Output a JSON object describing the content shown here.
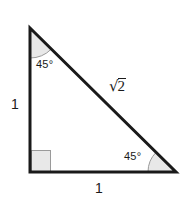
{
  "figure": {
    "type": "right-isosceles-triangle-diagram",
    "background_color": "#ffffff",
    "stroke_color": "#1a1a1a",
    "fill_color": "#ffffff",
    "marker_fill_color": "#e8e8e8",
    "marker_stroke_color": "#9a9a9a",
    "text_color": "#1a1a1a"
  },
  "labels": {
    "angle_top": "45°",
    "angle_bottom_right": "45°",
    "side_left": "1",
    "side_bottom": "1",
    "hypotenuse_sign": "√",
    "hypotenuse_radicand": "2",
    "hypotenuse": "√2"
  },
  "geometry": {
    "vertices": {
      "apex": [
        30,
        28
      ],
      "bottom_left": [
        30,
        172
      ],
      "bottom_right": [
        176,
        172
      ]
    },
    "right_angle_marker": {
      "x": 31,
      "y": 150,
      "width": 20,
      "height": 22
    },
    "arc_top": {
      "center": [
        30,
        28
      ],
      "radius": 30
    },
    "arc_bottom_right": {
      "center": [
        176,
        172
      ],
      "radius": 28
    },
    "stroke_width": 3
  }
}
